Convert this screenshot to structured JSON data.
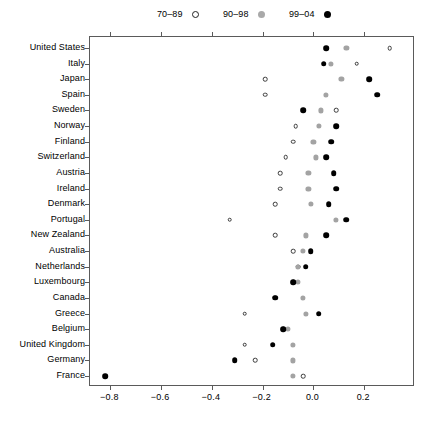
{
  "chart_data": {
    "type": "scatter",
    "title": "",
    "xlabel": "",
    "ylabel": "",
    "xlim": [
      -0.88,
      0.4
    ],
    "xticks": [
      -0.8,
      -0.6,
      -0.4,
      -0.2,
      0.0,
      0.2
    ],
    "xticklabels": [
      "−0.8",
      "−0.6",
      "−0.4",
      "−0.2",
      "0.0",
      "0.2"
    ],
    "grid": false,
    "legend_position": "top",
    "legend": [
      {
        "name": "70–89",
        "marker": "open-circle",
        "color": "#ffffff",
        "edge": "#222222"
      },
      {
        "name": "90–98",
        "marker": "filled-circle",
        "color": "#a3a3a3"
      },
      {
        "name": "99–04",
        "marker": "filled-circle",
        "color": "#000000"
      }
    ],
    "categories": [
      "United States",
      "Italy",
      "Japan",
      "Spain",
      "Sweden",
      "Norway",
      "Finland",
      "Switzerland",
      "Austria",
      "Ireland",
      "Denmark",
      "Portugal",
      "New Zealand",
      "Australia",
      "Netherlands",
      "Luxembourg",
      "Canada",
      "Greece",
      "Belgium",
      "United Kingdom",
      "Germany",
      "France"
    ],
    "series": [
      {
        "name": "70–89",
        "marker": "open-circle",
        "values": [
          0.3,
          0.17,
          -0.19,
          -0.19,
          0.09,
          -0.07,
          -0.08,
          -0.11,
          -0.13,
          -0.13,
          -0.15,
          -0.33,
          -0.15,
          -0.08,
          -0.06,
          -0.08,
          -0.15,
          -0.27,
          -0.12,
          -0.27,
          -0.23,
          -0.04
        ]
      },
      {
        "name": "90–98",
        "marker": "filled-circle",
        "values": [
          0.13,
          0.07,
          0.11,
          0.05,
          0.03,
          0.02,
          0.0,
          0.01,
          -0.02,
          -0.02,
          -0.01,
          0.09,
          -0.03,
          -0.04,
          -0.06,
          -0.06,
          -0.04,
          -0.03,
          -0.1,
          -0.08,
          -0.08,
          -0.08
        ]
      },
      {
        "name": "99–04",
        "marker": "filled-circle",
        "values": [
          0.05,
          0.04,
          0.22,
          0.25,
          -0.04,
          0.09,
          0.07,
          0.05,
          0.08,
          0.09,
          0.06,
          0.13,
          0.05,
          -0.01,
          -0.03,
          -0.08,
          -0.15,
          0.02,
          -0.12,
          -0.16,
          -0.31,
          -0.82
        ]
      }
    ]
  }
}
